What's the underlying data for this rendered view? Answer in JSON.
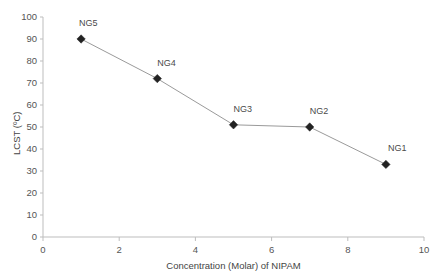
{
  "chart_data": {
    "type": "line",
    "title": "",
    "xlabel": "Concentration (Molar) of NIPAM",
    "ylabel": "LCST (ºC)",
    "x": [
      1,
      3,
      5,
      7,
      9
    ],
    "values": [
      90,
      72,
      51,
      50,
      33
    ],
    "point_labels": [
      "NG5",
      "NG4",
      "NG3",
      "NG2",
      "NG1"
    ],
    "xlim": [
      0,
      10
    ],
    "ylim": [
      0,
      100
    ],
    "xticks": [
      0,
      2,
      4,
      6,
      8,
      10
    ],
    "yticks": [
      0,
      10,
      20,
      30,
      40,
      50,
      60,
      70,
      80,
      90,
      100
    ],
    "xtick_labels": [
      "0",
      "2",
      "4",
      "6",
      "8",
      "10"
    ],
    "ytick_labels": [
      "0",
      "10",
      "20",
      "30",
      "40",
      "50",
      "60",
      "70",
      "80",
      "90",
      "100"
    ],
    "grid": false,
    "legend": "none",
    "marker": "diamond",
    "marker_color": "#222222",
    "line_color": "#9a9a9a",
    "axis_color": "#bdbdbd",
    "background": "#ffffff"
  }
}
